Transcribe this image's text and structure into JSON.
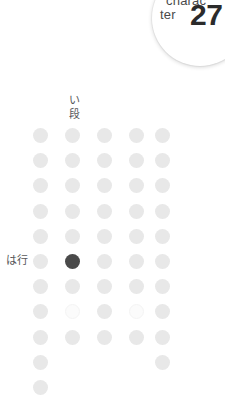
{
  "badge": {
    "word_top": "charac",
    "word_bottom": "ter",
    "number": "27",
    "accent_color": "#2b2b2b"
  },
  "column_header": {
    "chars": [
      "い",
      "段"
    ],
    "text": "い段"
  },
  "row_label": {
    "text": "は行"
  },
  "grid": {
    "columns": 5,
    "rows": 11,
    "colors": {
      "filled": "#e8e8e8",
      "current": "#4a4a4a",
      "faint": "#fbfbfb"
    },
    "cells": [
      [
        "filled",
        "filled",
        "filled",
        "filled",
        "filled"
      ],
      [
        "filled",
        "filled",
        "filled",
        "filled",
        "filled"
      ],
      [
        "filled",
        "filled",
        "filled",
        "filled",
        "filled"
      ],
      [
        "filled",
        "filled",
        "filled",
        "filled",
        "filled"
      ],
      [
        "filled",
        "filled",
        "filled",
        "filled",
        "filled"
      ],
      [
        "filled",
        "current",
        "filled",
        "filled",
        "filled"
      ],
      [
        "filled",
        "filled",
        "filled",
        "filled",
        "filled"
      ],
      [
        "filled",
        "faint",
        "filled",
        "faint",
        "filled"
      ],
      [
        "filled",
        "filled",
        "filled",
        "filled",
        "filled"
      ],
      [
        "filled",
        "empty",
        "empty",
        "empty",
        "filled"
      ],
      [
        "filled",
        "empty",
        "empty",
        "empty",
        "empty"
      ]
    ]
  }
}
